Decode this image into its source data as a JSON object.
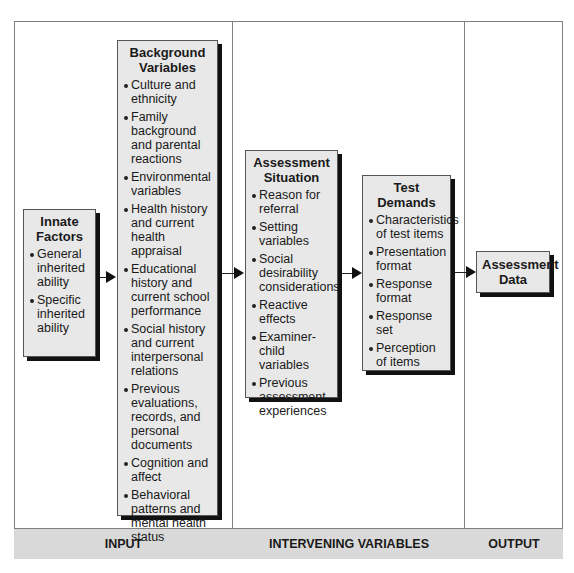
{
  "diagram": {
    "boxes": {
      "innate_factors": {
        "title": "Innate Factors",
        "items": [
          "General inherited ability",
          "Specific inherited ability"
        ]
      },
      "background_variables": {
        "title": "Background Variables",
        "items": [
          "Culture and ethnicity",
          "Family background and parental reactions",
          "Environmental variables",
          "Health history and current health appraisal",
          "Educational history and current school performance",
          "Social history and current interpersonal relations",
          "Previous evaluations, records, and personal documents",
          "Cognition and affect",
          "Behavioral patterns and mental health status"
        ]
      },
      "assessment_situation": {
        "title": "Assessment Situation",
        "items": [
          "Reason for referral",
          "Setting variables",
          "Social desirability considerations",
          "Reactive effects",
          "Examiner-child variables",
          "Previous assessment experiences"
        ]
      },
      "test_demands": {
        "title": "Test Demands",
        "items": [
          "Characteristics of test items",
          "Presentation format",
          "Response format",
          "Response set",
          "Perception of items"
        ]
      },
      "assessment_data": {
        "title": "Assessment Data"
      }
    },
    "sections": {
      "input": "INPUT",
      "intervening": "INTERVENING VARIABLES",
      "output": "OUTPUT"
    },
    "flow": [
      "Innate Factors -> Background Variables",
      "Background Variables -> Assessment Situation",
      "Assessment Situation -> Test Demands",
      "Test Demands -> Assessment Data"
    ],
    "colors": {
      "box_fill": "#e8e8e8",
      "footer_fill": "#d9d9d9",
      "border": "#808080",
      "shadow": "#111111"
    }
  }
}
